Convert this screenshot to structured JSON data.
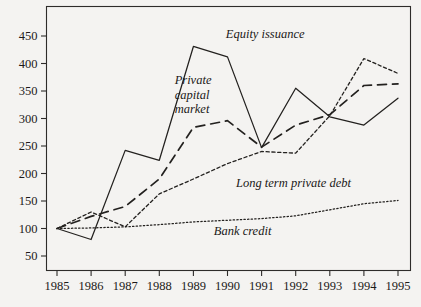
{
  "chart_data": {
    "type": "line",
    "title": "",
    "subtitle": "",
    "xlabel": "",
    "ylabel": "",
    "x": [
      1985,
      1986,
      1987,
      1988,
      1989,
      1990,
      1991,
      1992,
      1993,
      1994,
      1995
    ],
    "categories": [
      "1985",
      "1986",
      "1987",
      "1988",
      "1989",
      "1990",
      "1991",
      "1992",
      "1993",
      "1994",
      "1995"
    ],
    "xlim": [
      1985,
      1995
    ],
    "ylim": [
      0,
      475
    ],
    "yticks": [
      50,
      100,
      150,
      200,
      250,
      300,
      350,
      400,
      450
    ],
    "ytick_labels": [
      "50",
      "100",
      "150",
      "200",
      "250",
      "300",
      "350",
      "400",
      "450"
    ],
    "xticks": [
      1985,
      1986,
      1987,
      1988,
      1989,
      1990,
      1991,
      1992,
      1993,
      1994,
      1995
    ],
    "xtick_labels": [
      "1985",
      "1986",
      "1987",
      "1988",
      "1989",
      "1990",
      "1991",
      "1992",
      "1993",
      "1994",
      "1995"
    ],
    "grid": false,
    "legend_position": "inline-annotations",
    "index_base": 100,
    "series": [
      {
        "name": "Equity issuance",
        "style": "solid",
        "values": [
          100,
          80,
          242,
          224,
          431,
          412,
          247,
          355,
          303,
          288,
          337
        ],
        "label_x": 1989.95,
        "label_y": 447,
        "label_anchor": "start"
      },
      {
        "name": "Private capital market",
        "style": "dashed",
        "values": [
          100,
          122,
          140,
          190,
          284,
          296,
          248,
          288,
          307,
          360,
          363
        ],
        "label_x": 1988.45,
        "label_y": 362,
        "label_anchor": "start",
        "label_lines": [
          "Private",
          "capital",
          "market"
        ]
      },
      {
        "name": "Long term private debt",
        "style": "dotted-medium",
        "values": [
          100,
          130,
          103,
          163,
          190,
          218,
          240,
          237,
          305,
          409,
          382
        ],
        "label_x": 1990.25,
        "label_y": 176,
        "label_anchor": "start"
      },
      {
        "name": "Bank credit",
        "style": "dotted-fine",
        "values": [
          100,
          101,
          103,
          107,
          112,
          115,
          118,
          123,
          134,
          145,
          151
        ],
        "label_x": 1989.6,
        "label_y": 88,
        "label_anchor": "start"
      }
    ]
  },
  "plot": {
    "background_color": "#f4f3f1",
    "ink_color": "#23211f",
    "frame_color": "#2e2c2a"
  }
}
